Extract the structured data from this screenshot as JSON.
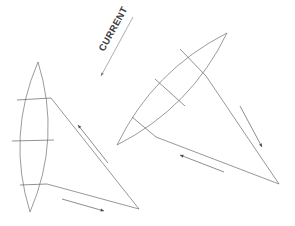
{
  "figure": {
    "background_color": "#ffffff",
    "line_color": "#6b6b6b",
    "label_color": "#3c3c3c",
    "width": 295,
    "height": 226
  },
  "current": {
    "label": "CURRENT",
    "label_x": 104,
    "label_y": 52,
    "label_rotation": -61,
    "arrow": {
      "x1": 133,
      "y1": 17,
      "x2": 101,
      "y2": 76,
      "direction": "down-left",
      "head_size": 3.2
    }
  },
  "assemblies": [
    {
      "name": "left-assembly",
      "sail": {
        "name": "left-sail",
        "tip_top_x": 38,
        "tip_top_y": 62,
        "tip_bottom_x": 30,
        "tip_bottom_y": 212,
        "bulge": 21,
        "orientation_deg": 93
      },
      "battens": [
        {
          "name": "left-batten-1",
          "x1": 17,
          "y1": 100,
          "x2": 51,
          "y2": 98
        },
        {
          "name": "left-batten-2",
          "x1": 12,
          "y1": 141,
          "x2": 54,
          "y2": 140
        },
        {
          "name": "left-batten-3",
          "x1": 20,
          "y1": 185,
          "x2": 47,
          "y2": 184
        }
      ],
      "frame": {
        "name": "left-frame",
        "apex_x": 51,
        "apex_y": 98,
        "tail_x": 139,
        "tail_y": 209,
        "foot_x": 47,
        "foot_y": 184
      },
      "arrows": [
        {
          "name": "left-upper-arrow",
          "x1": 108,
          "y1": 163,
          "x2": 78,
          "y2": 125,
          "direction": "up-left"
        },
        {
          "name": "left-lower-arrow",
          "x1": 62,
          "y1": 199,
          "x2": 104,
          "y2": 211,
          "direction": "right-down"
        }
      ]
    },
    {
      "name": "right-assembly",
      "sail": {
        "name": "right-sail",
        "tip_top_x": 227,
        "tip_top_y": 33,
        "tip_bottom_x": 117,
        "tip_bottom_y": 145,
        "bulge": 20,
        "orientation_deg": 45
      },
      "battens": [
        {
          "name": "right-batten-1",
          "x1": 180,
          "y1": 49,
          "x2": 206,
          "y2": 76
        },
        {
          "name": "right-batten-2",
          "x1": 155,
          "y1": 79,
          "x2": 185,
          "y2": 106
        },
        {
          "name": "right-batten-3",
          "x1": 132,
          "y1": 117,
          "x2": 156,
          "y2": 137
        }
      ],
      "frame": {
        "name": "right-frame",
        "apex_x": 206,
        "apex_y": 76,
        "tail_x": 279,
        "tail_y": 184,
        "foot_x": 156,
        "foot_y": 137
      },
      "arrows": [
        {
          "name": "right-side-arrow",
          "x1": 240,
          "y1": 106,
          "x2": 262,
          "y2": 147,
          "direction": "down-right"
        },
        {
          "name": "right-lower-arrow",
          "x1": 224,
          "y1": 172,
          "x2": 180,
          "y2": 155,
          "direction": "up-left"
        }
      ]
    }
  ]
}
